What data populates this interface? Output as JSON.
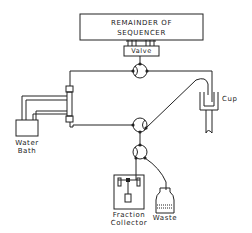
{
  "diagram": {
    "sequencer_box": {
      "line1": "REMAINDER OF",
      "line2": "SEQUENCER"
    },
    "valve_label": "Valve",
    "cup_label": "Cup",
    "water_bath": {
      "line1": "Water",
      "line2": "Bath"
    },
    "fraction_collector": {
      "line1": "Fraction",
      "line2": "Collector"
    },
    "waste_label": "Waste",
    "colors": {
      "line": "#222222",
      "background": "#ffffff"
    }
  }
}
